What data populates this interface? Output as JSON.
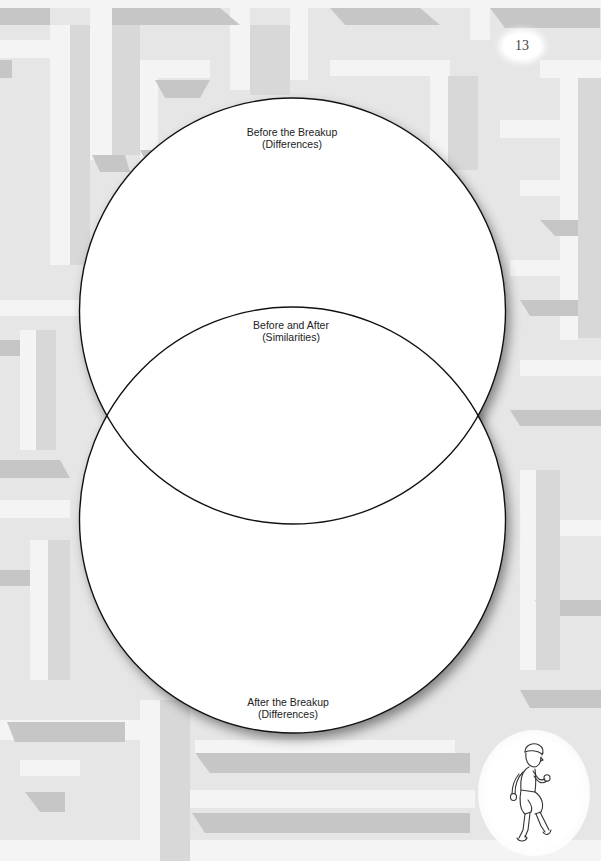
{
  "page": {
    "number": "13",
    "background": "maze-pattern"
  },
  "venn": {
    "top_circle": {
      "title": "Before the Breakup",
      "subtitle": "(Differences)"
    },
    "overlap": {
      "title": "Before and After",
      "subtitle": "(Similarities)"
    },
    "bottom_circle": {
      "title": "After the Breakup",
      "subtitle": "(Differences)"
    }
  },
  "illustration": {
    "icon": "walking-boy-icon"
  },
  "colors": {
    "background": "#e9e9e9",
    "maze_dark": "#c4c4c4",
    "maze_mid": "#d6d6d6",
    "maze_light": "#f3f3f3",
    "circle_fill": "#ffffff",
    "circle_stroke": "#111111"
  }
}
